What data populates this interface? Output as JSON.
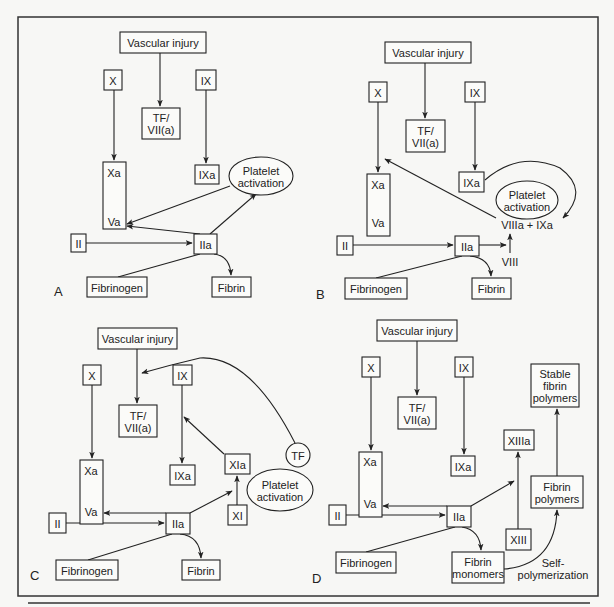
{
  "figure": {
    "frame": {
      "x": 18,
      "y": 17,
      "width": 580,
      "height": 579
    },
    "bottom_rule": {
      "x1": 28,
      "x2": 590,
      "y": 603
    },
    "colors": {
      "stroke": "#222222",
      "box_fill": "#fbfbf9",
      "background": "#f7f7f5"
    }
  },
  "panels": [
    {
      "id": "A",
      "label": "A",
      "label_pos": [
        54,
        296
      ],
      "nodes": [
        {
          "id": "vascular-injury",
          "type": "rect",
          "lines": [
            "Vascular injury"
          ],
          "x": 120,
          "y": 32,
          "w": 86,
          "h": 21
        },
        {
          "id": "x",
          "type": "rect",
          "lines": [
            "X"
          ],
          "x": 104,
          "y": 70,
          "w": 18,
          "h": 20
        },
        {
          "id": "ix",
          "type": "rect",
          "lines": [
            "IX"
          ],
          "x": 196,
          "y": 70,
          "w": 20,
          "h": 20
        },
        {
          "id": "tf-vii-a",
          "type": "rect",
          "lines": [
            "TF/",
            "VII(a)"
          ],
          "x": 142,
          "y": 108,
          "w": 38,
          "h": 31
        },
        {
          "id": "xa-va-complex",
          "type": "rect",
          "lines": [],
          "x": 103,
          "y": 162,
          "w": 23,
          "h": 67
        },
        {
          "id": "xa-label",
          "type": "text",
          "lines": [
            "Xa"
          ],
          "x": 114,
          "y": 173
        },
        {
          "id": "va-label",
          "type": "text",
          "lines": [
            "Va"
          ],
          "x": 114,
          "y": 222
        },
        {
          "id": "ixa",
          "type": "rect",
          "lines": [
            "IXa"
          ],
          "x": 195,
          "y": 165,
          "w": 24,
          "h": 19
        },
        {
          "id": "platelet-activation",
          "type": "ellipse",
          "lines": [
            "Platelet",
            "activation"
          ],
          "cx": 261,
          "cy": 176,
          "rx": 32,
          "ry": 19
        },
        {
          "id": "ii",
          "type": "rect",
          "lines": [
            "II"
          ],
          "x": 71,
          "y": 234,
          "w": 15,
          "h": 18
        },
        {
          "id": "iia",
          "type": "rect",
          "lines": [
            "IIa"
          ],
          "x": 194,
          "y": 234,
          "w": 23,
          "h": 20
        },
        {
          "id": "fibrinogen",
          "type": "rect",
          "lines": [
            "Fibrinogen"
          ],
          "x": 87,
          "y": 277,
          "w": 60,
          "h": 20
        },
        {
          "id": "fibrin",
          "type": "rect",
          "lines": [
            "Fibrin"
          ],
          "x": 212,
          "y": 277,
          "w": 39,
          "h": 20
        }
      ],
      "edges": [
        {
          "d": "M160,53 L160,106",
          "arrow": true
        },
        {
          "d": "M114,90 L114,160",
          "arrow": true
        },
        {
          "d": "M206,90 L206,163",
          "arrow": true
        },
        {
          "d": "M114,183 L114,213",
          "arrow": false
        },
        {
          "d": "M230,186 L127,224",
          "arrow": true
        },
        {
          "d": "M200,234 L127,226",
          "arrow": true
        },
        {
          "d": "M210,234 L256,194",
          "arrow": true
        },
        {
          "d": "M86,243 L192,243",
          "arrow": true
        },
        {
          "d": "M118,277 L200,254",
          "arrow": false
        },
        {
          "d": "M214,254 Q230,256 231,275",
          "arrow": true
        }
      ]
    },
    {
      "id": "B",
      "label": "B",
      "label_pos": [
        316,
        299
      ],
      "nodes": [
        {
          "id": "vascular-injury",
          "type": "rect",
          "lines": [
            "Vascular injury"
          ],
          "x": 385,
          "y": 42,
          "w": 86,
          "h": 21
        },
        {
          "id": "x",
          "type": "rect",
          "lines": [
            "X"
          ],
          "x": 369,
          "y": 82,
          "w": 18,
          "h": 20
        },
        {
          "id": "ix",
          "type": "rect",
          "lines": [
            "IX"
          ],
          "x": 465,
          "y": 82,
          "w": 20,
          "h": 20
        },
        {
          "id": "tf-vii-a",
          "type": "rect",
          "lines": [
            "TF/",
            "VII(a)"
          ],
          "x": 406,
          "y": 120,
          "w": 39,
          "h": 32
        },
        {
          "id": "xa-va-complex",
          "type": "rect",
          "lines": [],
          "x": 367,
          "y": 174,
          "w": 23,
          "h": 62
        },
        {
          "id": "xa-label",
          "type": "text",
          "lines": [
            "Xa"
          ],
          "x": 378,
          "y": 185
        },
        {
          "id": "va-label",
          "type": "text",
          "lines": [
            "Va"
          ],
          "x": 378,
          "y": 223
        },
        {
          "id": "ixa",
          "type": "rect",
          "lines": [
            "IXa"
          ],
          "x": 459,
          "y": 172,
          "w": 25,
          "h": 20
        },
        {
          "id": "platelet-activation",
          "type": "ellipse",
          "lines": [
            "Platelet",
            "activation"
          ],
          "cx": 527,
          "cy": 200,
          "rx": 31,
          "ry": 19
        },
        {
          "id": "viiia-ixa",
          "type": "text",
          "lines": [
            "VIIIa + IXa"
          ],
          "x": 527,
          "y": 225
        },
        {
          "id": "ii",
          "type": "rect",
          "lines": [
            "II"
          ],
          "x": 337,
          "y": 236,
          "w": 16,
          "h": 19
        },
        {
          "id": "iia",
          "type": "rect",
          "lines": [
            "IIa"
          ],
          "x": 455,
          "y": 236,
          "w": 24,
          "h": 20
        },
        {
          "id": "viii",
          "type": "text",
          "lines": [
            "VIII"
          ],
          "x": 510,
          "y": 262
        },
        {
          "id": "fibrinogen",
          "type": "rect",
          "lines": [
            "Fibrinogen"
          ],
          "x": 345,
          "y": 278,
          "w": 62,
          "h": 21
        },
        {
          "id": "fibrin",
          "type": "rect",
          "lines": [
            "Fibrin"
          ],
          "x": 472,
          "y": 278,
          "w": 39,
          "h": 21
        }
      ],
      "edges": [
        {
          "d": "M425,63 L425,118",
          "arrow": true
        },
        {
          "d": "M378,102 L378,172",
          "arrow": true
        },
        {
          "d": "M475,102 L475,170",
          "arrow": true
        },
        {
          "d": "M378,194 L378,215",
          "arrow": false
        },
        {
          "d": "M496,218 L385,159",
          "arrow": true
        },
        {
          "d": "M485,180 Q520,150 560,168 Q590,190 563,218",
          "arrow": true
        },
        {
          "d": "M353,245 L453,245",
          "arrow": true
        },
        {
          "d": "M479,245 L506,245",
          "arrow": true
        },
        {
          "d": "M510,253 L510,234",
          "arrow": true
        },
        {
          "d": "M376,278 L462,256",
          "arrow": false
        },
        {
          "d": "M470,256 Q490,258 491,276",
          "arrow": true
        }
      ]
    },
    {
      "id": "C",
      "label": "C",
      "label_pos": [
        30,
        580
      ],
      "nodes": [
        {
          "id": "vascular-injury",
          "type": "rect",
          "lines": [
            "Vascular injury"
          ],
          "x": 98,
          "y": 328,
          "w": 79,
          "h": 21
        },
        {
          "id": "x",
          "type": "rect",
          "lines": [
            "X"
          ],
          "x": 83,
          "y": 365,
          "w": 18,
          "h": 20
        },
        {
          "id": "ix",
          "type": "rect",
          "lines": [
            "IX"
          ],
          "x": 173,
          "y": 365,
          "w": 19,
          "h": 20
        },
        {
          "id": "tf-vii-a",
          "type": "rect",
          "lines": [
            "TF/",
            "VII(a)"
          ],
          "x": 119,
          "y": 405,
          "w": 38,
          "h": 32
        },
        {
          "id": "xa-va-complex",
          "type": "rect",
          "lines": [],
          "x": 80,
          "y": 460,
          "w": 23,
          "h": 64
        },
        {
          "id": "xa-label",
          "type": "text",
          "lines": [
            "Xa"
          ],
          "x": 91,
          "y": 471
        },
        {
          "id": "va-label",
          "type": "text",
          "lines": [
            "Va"
          ],
          "x": 91,
          "y": 512
        },
        {
          "id": "ixa",
          "type": "rect",
          "lines": [
            "IXa"
          ],
          "x": 170,
          "y": 465,
          "w": 25,
          "h": 20
        },
        {
          "id": "xia",
          "type": "rect",
          "lines": [
            "XIa"
          ],
          "x": 225,
          "y": 454,
          "w": 25,
          "h": 20
        },
        {
          "id": "tf",
          "type": "ellipse",
          "lines": [
            "TF"
          ],
          "cx": 298,
          "cy": 455,
          "rx": 12,
          "ry": 12
        },
        {
          "id": "platelet-activation",
          "type": "ellipse",
          "lines": [
            "Platelet",
            "activation"
          ],
          "cx": 280,
          "cy": 490,
          "rx": 33,
          "ry": 21
        },
        {
          "id": "xi",
          "type": "rect",
          "lines": [
            "XI"
          ],
          "x": 228,
          "y": 505,
          "w": 19,
          "h": 20
        },
        {
          "id": "ii",
          "type": "rect",
          "lines": [
            "II"
          ],
          "x": 49,
          "y": 513,
          "w": 17,
          "h": 20
        },
        {
          "id": "iia",
          "type": "rect",
          "lines": [
            "IIa"
          ],
          "x": 166,
          "y": 513,
          "w": 24,
          "h": 21
        },
        {
          "id": "fibrinogen",
          "type": "rect",
          "lines": [
            "Fibrinogen"
          ],
          "x": 56,
          "y": 560,
          "w": 62,
          "h": 20
        },
        {
          "id": "fibrin",
          "type": "rect",
          "lines": [
            "Fibrin"
          ],
          "x": 182,
          "y": 560,
          "w": 38,
          "h": 20
        }
      ],
      "edges": [
        {
          "d": "M137,349 L137,403",
          "arrow": true
        },
        {
          "d": "M92,385 L92,458",
          "arrow": true
        },
        {
          "d": "M182,385 L182,463",
          "arrow": true
        },
        {
          "d": "M87,480 L87,507",
          "arrow": false
        },
        {
          "d": "M94,480 L94,505",
          "arrow": true
        },
        {
          "d": "M224,454 L184,417",
          "arrow": true
        },
        {
          "d": "M295,443 Q250,355 200,358 Q170,365 142,373",
          "arrow": true
        },
        {
          "d": "M166,513 L104,513",
          "arrow": true
        },
        {
          "d": "M66,523 L164,523",
          "arrow": true
        },
        {
          "d": "M190,513 L232,491",
          "arrow": true
        },
        {
          "d": "M237,505 L237,476",
          "arrow": true
        },
        {
          "d": "M88,560 L172,534",
          "arrow": false
        },
        {
          "d": "M180,534 Q200,536 201,558",
          "arrow": true
        }
      ]
    },
    {
      "id": "D",
      "label": "D",
      "label_pos": [
        312,
        583
      ],
      "nodes": [
        {
          "id": "vascular-injury",
          "type": "rect",
          "lines": [
            "Vascular injury"
          ],
          "x": 377,
          "y": 320,
          "w": 80,
          "h": 21
        },
        {
          "id": "x",
          "type": "rect",
          "lines": [
            "X"
          ],
          "x": 362,
          "y": 357,
          "w": 18,
          "h": 20
        },
        {
          "id": "ix",
          "type": "rect",
          "lines": [
            "IX"
          ],
          "x": 455,
          "y": 357,
          "w": 18,
          "h": 20
        },
        {
          "id": "tf-vii-a",
          "type": "rect",
          "lines": [
            "TF/",
            "VII(a)"
          ],
          "x": 398,
          "y": 397,
          "w": 38,
          "h": 32
        },
        {
          "id": "stable-fibrin-polymers",
          "type": "rect",
          "lines": [
            "Stable",
            "fibrin",
            "polymers"
          ],
          "x": 531,
          "y": 364,
          "w": 48,
          "h": 43
        },
        {
          "id": "xiiia",
          "type": "rect",
          "lines": [
            "XIIIa"
          ],
          "x": 504,
          "y": 430,
          "w": 30,
          "h": 20
        },
        {
          "id": "xa-va-complex",
          "type": "rect",
          "lines": [],
          "x": 359,
          "y": 452,
          "w": 23,
          "h": 65
        },
        {
          "id": "xa-label",
          "type": "text",
          "lines": [
            "Xa"
          ],
          "x": 370,
          "y": 462
        },
        {
          "id": "va-label",
          "type": "text",
          "lines": [
            "Va"
          ],
          "x": 370,
          "y": 504
        },
        {
          "id": "ixa",
          "type": "rect",
          "lines": [
            "IXa"
          ],
          "x": 451,
          "y": 456,
          "w": 24,
          "h": 20
        },
        {
          "id": "fibrin-polymers",
          "type": "rect",
          "lines": [
            "Fibrin",
            "polymers"
          ],
          "x": 531,
          "y": 476,
          "w": 52,
          "h": 32
        },
        {
          "id": "ii",
          "type": "rect",
          "lines": [
            "II"
          ],
          "x": 329,
          "y": 505,
          "w": 17,
          "h": 20
        },
        {
          "id": "iia",
          "type": "rect",
          "lines": [
            "IIa"
          ],
          "x": 447,
          "y": 506,
          "w": 24,
          "h": 21
        },
        {
          "id": "xiii",
          "type": "rect",
          "lines": [
            "XIII"
          ],
          "x": 506,
          "y": 529,
          "w": 25,
          "h": 21
        },
        {
          "id": "fibrinogen",
          "type": "rect",
          "lines": [
            "Fibrinogen"
          ],
          "x": 336,
          "y": 552,
          "w": 60,
          "h": 21
        },
        {
          "id": "fibrin-monomers",
          "type": "rect",
          "lines": [
            "Fibrin",
            "monomers"
          ],
          "x": 452,
          "y": 552,
          "w": 52,
          "h": 31
        },
        {
          "id": "self-polymerization",
          "type": "text",
          "lines": [
            "Self-",
            "polymerization"
          ],
          "x": 553,
          "y": 569
        }
      ],
      "edges": [
        {
          "d": "M417,341 L417,395",
          "arrow": true
        },
        {
          "d": "M371,377 L371,450",
          "arrow": true
        },
        {
          "d": "M464,377 L464,454",
          "arrow": true
        },
        {
          "d": "M366,472 L366,500",
          "arrow": false
        },
        {
          "d": "M373,472 L373,496",
          "arrow": true
        },
        {
          "d": "M447,506 L383,506",
          "arrow": true
        },
        {
          "d": "M346,515 L445,515",
          "arrow": true
        },
        {
          "d": "M471,506 L514,481",
          "arrow": true
        },
        {
          "d": "M518,529 L518,452",
          "arrow": true
        },
        {
          "d": "M557,476 L557,409",
          "arrow": true
        },
        {
          "d": "M504,569 Q555,565 557,510",
          "arrow": true
        },
        {
          "d": "M366,552 L455,527",
          "arrow": false
        },
        {
          "d": "M462,527 Q480,530 481,550",
          "arrow": true
        }
      ]
    }
  ]
}
